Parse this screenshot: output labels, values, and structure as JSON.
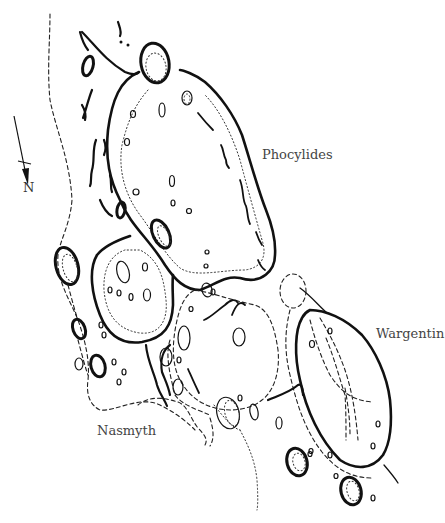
{
  "figure": {
    "labels": {
      "phocylides": "Phocylides",
      "wargentin": "Wargentin",
      "nasmyth": "Nasmyth"
    },
    "compass": {
      "label": "N",
      "icon": "north-arrow-icon"
    },
    "legend_styles": {
      "rim": "solid heavy line",
      "inner_floor_boundary": "dotted line",
      "outer_boundary": "dashed line"
    },
    "colors": {
      "ink": "#111111",
      "label_text": "#444444",
      "background": "#ffffff"
    }
  }
}
